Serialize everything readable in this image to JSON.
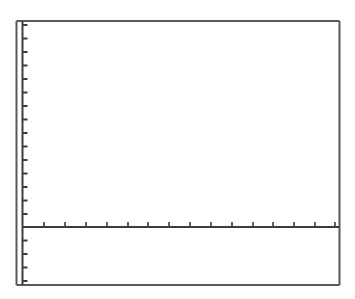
{
  "chart_data": {
    "type": "line",
    "title": "",
    "xlabel": "",
    "ylabel": "",
    "series": [],
    "grid": false,
    "legend": null,
    "axes": {
      "x_tick_count": 15,
      "y_ticks_above_axis": 15,
      "y_ticks_below_axis": 4,
      "tick_labels": []
    }
  },
  "colors": {
    "frame": "#5a5a5a",
    "axis": "#3c3c3c",
    "background": "#ffffff"
  },
  "layout": {
    "frame": {
      "left": 16.5,
      "top": 21,
      "right": 339.5,
      "bottom": 285
    },
    "y_axis_x": 22.5,
    "x_axis_y": 227,
    "x_ticks": [
      44,
      65,
      86,
      107,
      128,
      148,
      169,
      190,
      211,
      232,
      253,
      273,
      294,
      315,
      335
    ],
    "y_ticks": [
      25,
      38.5,
      52,
      65.5,
      79,
      92.5,
      106,
      119.5,
      133,
      146.5,
      160,
      173.5,
      187,
      200.5,
      214,
      240.5,
      254,
      267.5,
      281
    ]
  }
}
